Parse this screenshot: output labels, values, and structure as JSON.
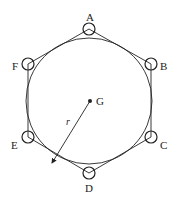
{
  "diagram": {
    "type": "hexagon-inscribed-in-circle",
    "circle": {
      "cx": 89,
      "cy": 101,
      "r": 63
    },
    "center": {
      "label": "G",
      "x": 90,
      "y": 101
    },
    "radius_label": "r",
    "vertices": [
      {
        "label": "A",
        "x": 89,
        "y": 29
      },
      {
        "label": "B",
        "x": 151,
        "y": 64
      },
      {
        "label": "C",
        "x": 151,
        "y": 137
      },
      {
        "label": "D",
        "x": 89,
        "y": 173
      },
      {
        "label": "E",
        "x": 28,
        "y": 137
      },
      {
        "label": "F",
        "x": 28,
        "y": 64
      }
    ],
    "colors": {
      "stroke": "#222222",
      "background": "#ffffff"
    }
  }
}
